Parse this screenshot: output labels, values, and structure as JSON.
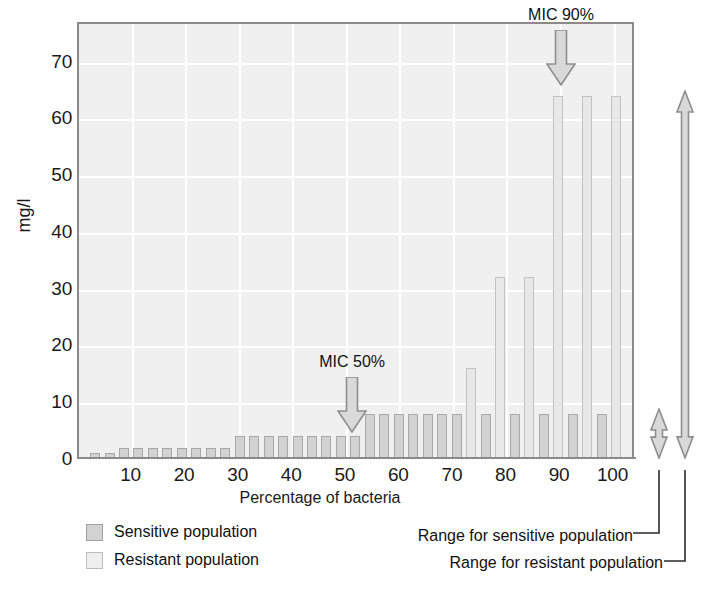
{
  "chart_data": {
    "type": "bar",
    "title": "",
    "xlabel": "Percentage of bacteria",
    "ylabel": "mg/l",
    "xlim": [
      0,
      104
    ],
    "ylim": [
      0,
      77
    ],
    "grid": true,
    "x_ticks": [
      10,
      20,
      30,
      40,
      50,
      60,
      70,
      80,
      90,
      100
    ],
    "y_ticks": [
      0,
      10,
      20,
      30,
      40,
      50,
      60,
      70
    ],
    "legend_position": "below-left",
    "categories": [
      3,
      5.7,
      8.4,
      11.1,
      13.8,
      16.5,
      19.2,
      21.9,
      24.6,
      27.3,
      30,
      32.7,
      35.4,
      38.1,
      40.8,
      43.5,
      46.2,
      48.9,
      51.6,
      54.3,
      57,
      59.7,
      62.4,
      65.1,
      67.8,
      70.5,
      73.2,
      76,
      78.7,
      81.4,
      84.1,
      86.8,
      89.5,
      92.2,
      94.9,
      97.6,
      100.3
    ],
    "values": [
      1,
      1,
      2,
      2,
      2,
      2,
      2,
      2,
      2,
      2,
      4,
      4,
      4,
      4,
      4,
      4,
      4,
      4,
      4,
      8,
      8,
      8,
      8,
      8,
      8,
      8,
      16,
      8,
      32,
      8,
      32,
      8,
      64,
      8,
      64,
      8,
      64
    ],
    "bar_population": [
      "sensitive",
      "sensitive",
      "sensitive",
      "sensitive",
      "sensitive",
      "sensitive",
      "sensitive",
      "sensitive",
      "sensitive",
      "sensitive",
      "sensitive",
      "sensitive",
      "sensitive",
      "sensitive",
      "sensitive",
      "sensitive",
      "sensitive",
      "sensitive",
      "sensitive",
      "sensitive",
      "sensitive",
      "sensitive",
      "sensitive",
      "sensitive",
      "sensitive",
      "sensitive",
      "resistant",
      "sensitive",
      "resistant",
      "sensitive",
      "resistant",
      "sensitive",
      "resistant",
      "sensitive",
      "resistant",
      "sensitive",
      "resistant"
    ],
    "series": [
      {
        "name": "Sensitive population",
        "color": "#d2d2d2"
      },
      {
        "name": "Resistant population",
        "color": "#efefef"
      }
    ],
    "annotations": [
      {
        "label": "MIC 50%",
        "x": 51,
        "y": 5,
        "arrow": "down"
      },
      {
        "label": "MIC 90%",
        "x": 90,
        "y": 66,
        "arrow": "down"
      }
    ],
    "ranges": [
      {
        "label": "Range for sensitive population",
        "from": 0,
        "to": 9
      },
      {
        "label": "Range for resistant population",
        "from": 0,
        "to": 65
      }
    ]
  },
  "axes": {
    "y_label": "mg/l",
    "y_ticks": [
      "0",
      "10",
      "20",
      "30",
      "40",
      "50",
      "60",
      "70"
    ],
    "x_label": "Percentage of bacteria",
    "x_ticks": [
      "10",
      "20",
      "30",
      "40",
      "50",
      "60",
      "70",
      "80",
      "90",
      "100"
    ]
  },
  "annotations": {
    "mic50": "MIC 50%",
    "mic90": "MIC 90%"
  },
  "legend": {
    "items": [
      {
        "label": "Sensitive population",
        "color": "#d2d2d2"
      },
      {
        "label": "Resistant population",
        "color": "#efefef"
      }
    ]
  },
  "ranges": {
    "sensitive": "Range for sensitive population",
    "resistant": "Range for resistant population"
  },
  "colors": {
    "plot_background": "#f0f0f0",
    "gridline": "#ffffff",
    "axis": "#8a8a8a",
    "sensitive_bar": "#d2d2d2",
    "resistant_bar": "#efefef",
    "text": "#1a1a1a",
    "arrow_fill": "#d9d9d9",
    "arrow_stroke": "#8e8e8e"
  }
}
